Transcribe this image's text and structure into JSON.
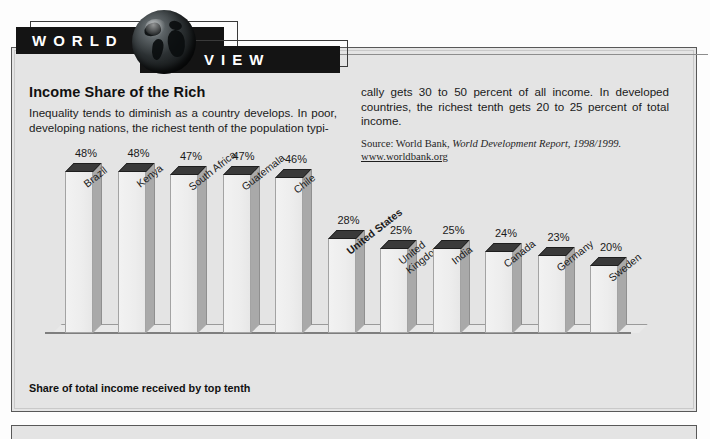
{
  "banner": {
    "word1": "WORLD",
    "word2": "VIEW",
    "globe_icon": "globe-icon"
  },
  "article": {
    "headline": "Income Share of the Rich",
    "body_left": "Inequality tends to diminish as a country develops. In poor, developing nations, the richest tenth of the population typi-",
    "body_right": "cally gets 30 to 50 percent of all income. In developed countries, the richest tenth gets 20 to 25 percent of total income.",
    "source_prefix": "Source: World Bank, ",
    "source_italic": "World Development Report, 1998/1999.",
    "source_url": "www.worldbank.org"
  },
  "chart_caption": "Share of total income received by top tenth",
  "colors": {
    "panel_bg": "#e4e4e4",
    "panel_border": "#585858",
    "banner_bar": "#141414",
    "bar_top_face": "#3a3a3a",
    "bar_front_face": "#efefef",
    "bar_side_face": "#a9a9a9",
    "text": "#1a1a1a"
  },
  "chart_data": {
    "type": "bar",
    "title": "Income Share of the Rich",
    "xlabel": "",
    "ylabel": "Share of total income received by top tenth",
    "ylim": [
      0,
      50
    ],
    "grid": false,
    "legend": "none",
    "value_suffix": "%",
    "highlight_category": "United States",
    "categories": [
      "Brazil",
      "Kenya",
      "South Africa",
      "Guatemala",
      "Chile",
      "United States",
      "United Kingdom",
      "India",
      "Canada",
      "Germany",
      "Sweden"
    ],
    "category_lines": [
      [
        "Brazil"
      ],
      [
        "Kenya"
      ],
      [
        "South Africa"
      ],
      [
        "Guatemala"
      ],
      [
        "Chile"
      ],
      [
        "United States"
      ],
      [
        "United",
        "Kingdom"
      ],
      [
        "India"
      ],
      [
        "Canada"
      ],
      [
        "Germany"
      ],
      [
        "Sweden"
      ]
    ],
    "values": [
      48,
      48,
      47,
      47,
      46,
      28,
      25,
      25,
      24,
      23,
      20
    ],
    "labels": [
      "48%",
      "48%",
      "47%",
      "47%",
      "46%",
      "28%",
      "25%",
      "25%",
      "24%",
      "23%",
      "20%"
    ]
  }
}
